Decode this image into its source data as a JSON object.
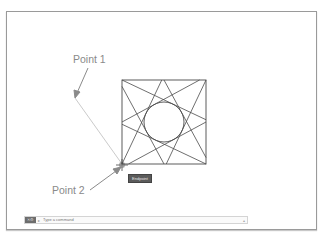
{
  "app": {
    "type": "CAD drawing viewport"
  },
  "annotations": {
    "point1_label": "Point 1",
    "point2_label": "Point 2"
  },
  "tooltip": {
    "text": "Endpoint"
  },
  "drawing": {
    "shape": "square with pinwheel of 8 tangent lines around central circle",
    "line_color": "#4a4a4a",
    "rubberband_color": "#bdbdbd",
    "arrow_color": "#8a8a8a"
  },
  "command_line": {
    "placeholder": "Type a command",
    "button_icons": [
      "close-icon",
      "wrench-icon"
    ],
    "dropdown_icon": "chevron-up-icon"
  }
}
